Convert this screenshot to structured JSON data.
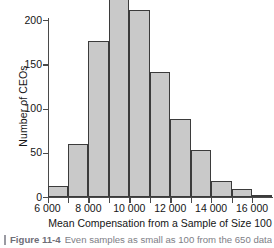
{
  "figure": {
    "caption_number": "Figure 11-4",
    "caption_text": "Even samples as small as 100 from the 650 data",
    "caption_rule": "caption-rule"
  },
  "chart_data": {
    "type": "bar",
    "subtype": "histogram",
    "title": "",
    "xlabel": "Mean Compensation from a Sample of Size 100",
    "ylabel": "Number of CEOs",
    "xlim": [
      6000,
      17000
    ],
    "ylim": [
      0,
      230
    ],
    "grid": false,
    "legend": null,
    "bin_width": 1000,
    "x_tick_values": [
      6000,
      7000,
      8000,
      9000,
      10000,
      11000,
      12000,
      13000,
      14000,
      15000,
      16000,
      17000
    ],
    "x_tick_labels": [
      "6 000",
      "",
      "8 000",
      "",
      "10 000",
      "",
      "12 000",
      "",
      "14 000",
      "",
      "16 000",
      ""
    ],
    "y_tick_values": [
      0,
      50,
      100,
      150,
      200
    ],
    "y_tick_labels": [
      "0",
      "50",
      "100",
      "150",
      "200"
    ],
    "bins": [
      {
        "left": 6000,
        "right": 7000,
        "label": "6 000-7 000",
        "value": 12
      },
      {
        "left": 7000,
        "right": 8000,
        "label": "7 000-8 000",
        "value": 60
      },
      {
        "left": 8000,
        "right": 9000,
        "label": "8 000-9 000",
        "value": 176
      },
      {
        "left": 9000,
        "right": 10000,
        "label": "9 000-10 000",
        "value": 227
      },
      {
        "left": 10000,
        "right": 11000,
        "label": "10 000-11 000",
        "value": 211
      },
      {
        "left": 11000,
        "right": 12000,
        "label": "11 000-12 000",
        "value": 141
      },
      {
        "left": 12000,
        "right": 13000,
        "label": "12 000-13 000",
        "value": 88
      },
      {
        "left": 13000,
        "right": 14000,
        "label": "13 000-14 000",
        "value": 53
      },
      {
        "left": 14000,
        "right": 15000,
        "label": "14 000-15 000",
        "value": 18
      },
      {
        "left": 15000,
        "right": 16000,
        "label": "15 000-16 000",
        "value": 9
      },
      {
        "left": 16000,
        "right": 17000,
        "label": "16 000-17 000",
        "value": 1
      }
    ],
    "categories": [
      "6 000-7 000",
      "7 000-8 000",
      "8 000-9 000",
      "9 000-10 000",
      "10 000-11 000",
      "11 000-12 000",
      "12 000-13 000",
      "13 000-14 000",
      "14 000-15 000",
      "15 000-16 000",
      "16 000-17 000"
    ],
    "values": [
      12,
      60,
      176,
      227,
      211,
      141,
      88,
      53,
      18,
      9,
      1
    ],
    "colors": {
      "bar_fill": "#c9c9c9",
      "bar_stroke": "#3b3b3b",
      "axis": "#4a4a4a",
      "text": "#151515"
    }
  }
}
